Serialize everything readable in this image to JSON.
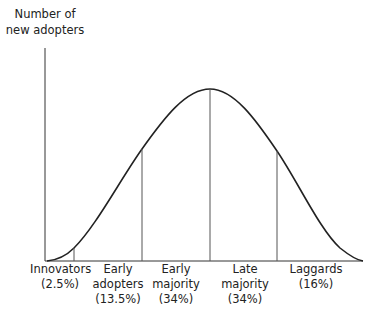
{
  "diagram": {
    "y_axis_label_line1": "Number of",
    "y_axis_label_line2": "new adopters",
    "categories": [
      {
        "name_line1": "Innovators",
        "name_line2": "(2.5%)",
        "name_line3": "",
        "share_percent": 2.5
      },
      {
        "name_line1": "Early",
        "name_line2": "adopters",
        "name_line3": "(13.5%)",
        "share_percent": 13.5
      },
      {
        "name_line1": "Early",
        "name_line2": "majority",
        "name_line3": "(34%)",
        "share_percent": 34
      },
      {
        "name_line1": "Late",
        "name_line2": "majority",
        "name_line3": "(34%)",
        "share_percent": 34
      },
      {
        "name_line1": "Laggards",
        "name_line2": "(16%)",
        "name_line3": "",
        "share_percent": 16
      }
    ],
    "curve": "bell-shaped (normal distribution) curve",
    "line_color": "#222222"
  }
}
